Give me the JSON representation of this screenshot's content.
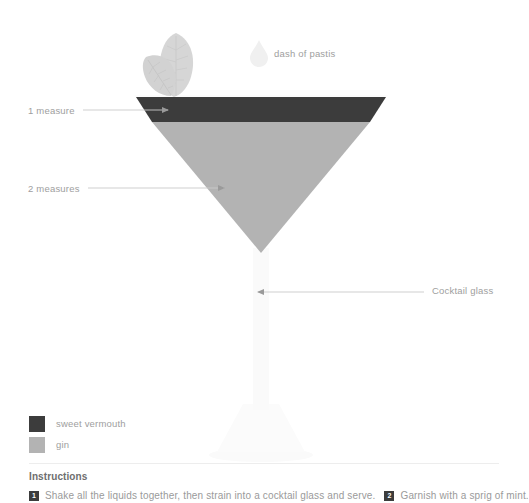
{
  "diagram": {
    "glass_type": "cocktail glass",
    "callouts": [
      {
        "id": "measure-1",
        "label": "1 measure",
        "points_to": "sweet vermouth layer"
      },
      {
        "id": "measure-2",
        "label": "2 measures",
        "points_to": "gin layer"
      },
      {
        "id": "glass",
        "label": "Cocktail glass",
        "points_to": "glass stem"
      },
      {
        "id": "pastis",
        "label": "dash of pastis",
        "points_to": "droplet icon"
      }
    ],
    "garnish_icon": "mint-leaves-icon",
    "droplet_icon": "droplet-icon"
  },
  "legend": {
    "items": [
      {
        "label": "sweet vermouth",
        "color": "#3c3c3c"
      },
      {
        "label": "gin",
        "color": "#b3b3b3"
      }
    ]
  },
  "layers": [
    {
      "name": "sweet vermouth",
      "measure": "1 measure",
      "color": "#3c3c3c"
    },
    {
      "name": "gin",
      "measure": "2 measures",
      "color": "#b3b3b3"
    }
  ],
  "colors": {
    "vermouth": "#3c3c3c",
    "gin": "#b3b3b3",
    "glass": "#fafafa",
    "leaf": "#d8d8d8",
    "droplet": "#f2f2f2",
    "leader_line": "#c9c9c9",
    "text": "#9e9e9e",
    "divider": "#ededed"
  },
  "instructions": {
    "title": "Instructions",
    "steps": [
      {
        "number": "1",
        "text": "Shake all the liquids together, then strain into a cocktail glass and serve."
      },
      {
        "number": "2",
        "text": "Garnish with a sprig of mint."
      }
    ]
  }
}
